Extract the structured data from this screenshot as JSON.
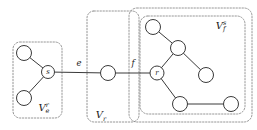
{
  "figure": {
    "type": "graph-diagram",
    "width": 257,
    "height": 130,
    "background": "#ffffff",
    "node_fill": "#ffffff",
    "node_stroke": "#3a3a3a",
    "edge_color": "#3a3a3a",
    "box_color": "#8a8a8a"
  },
  "groups": [
    {
      "id": "group-ve-r",
      "base": "V",
      "sub": "e",
      "sup": "r",
      "label_x": 44,
      "label_y": 111,
      "box": {
        "x": 13,
        "y": 42,
        "w": 49,
        "h": 76,
        "r": 7
      }
    },
    {
      "id": "group-vr",
      "base": "V",
      "sub": "r",
      "sup": "",
      "label_x": 101,
      "label_y": 118,
      "box": {
        "x": 87,
        "y": 11,
        "w": 52,
        "h": 111,
        "r": 7
      }
    },
    {
      "id": "group-vf-s-outer",
      "base": "",
      "sub": "",
      "sup": "",
      "label_x": 0,
      "label_y": 0,
      "box": {
        "x": 129,
        "y": 8,
        "w": 123,
        "h": 114,
        "r": 8
      }
    },
    {
      "id": "group-vf-s",
      "base": "V",
      "sub": "f",
      "sup": "s",
      "label_x": 221,
      "label_y": 29,
      "box": {
        "x": 140,
        "y": 16,
        "w": 105,
        "h": 98,
        "r": 8
      }
    }
  ],
  "nodes": [
    {
      "id": "n-left-top",
      "cx": 24,
      "cy": 53,
      "r": 7.5,
      "label": ""
    },
    {
      "id": "n-s",
      "cx": 48,
      "cy": 72,
      "r": 6.5,
      "label": "s"
    },
    {
      "id": "n-left-bottom",
      "cx": 24,
      "cy": 98,
      "r": 7.5,
      "label": ""
    },
    {
      "id": "n-mid",
      "cx": 108,
      "cy": 73,
      "r": 7.5,
      "label": ""
    },
    {
      "id": "n-f-top",
      "cx": 153,
      "cy": 27,
      "r": 7.5,
      "label": ""
    },
    {
      "id": "n-f-mid",
      "cx": 178,
      "cy": 48,
      "r": 7.5,
      "label": ""
    },
    {
      "id": "n-r",
      "cx": 157,
      "cy": 73,
      "r": 7.0,
      "label": "r"
    },
    {
      "id": "n-f-right",
      "cx": 206,
      "cy": 75,
      "r": 7.5,
      "label": ""
    },
    {
      "id": "n-f-botleft",
      "cx": 180,
      "cy": 104,
      "r": 7.5,
      "label": ""
    },
    {
      "id": "n-f-botright",
      "cx": 231,
      "cy": 104,
      "r": 7.5,
      "label": ""
    }
  ],
  "edges": [
    {
      "id": "e-lefttop-s",
      "x1": 24,
      "y1": 53,
      "x2": 48,
      "y2": 72,
      "label": "",
      "label_x": 0,
      "label_y": 0
    },
    {
      "id": "e-leftbot-s",
      "x1": 24,
      "y1": 98,
      "x2": 48,
      "y2": 72,
      "label": "",
      "label_x": 0,
      "label_y": 0
    },
    {
      "id": "edge-e",
      "x1": 48,
      "y1": 72,
      "x2": 108,
      "y2": 73,
      "label": "e",
      "label_x": 79,
      "label_y": 66
    },
    {
      "id": "edge-f",
      "x1": 108,
      "y1": 73,
      "x2": 157,
      "y2": 73,
      "label": "f",
      "label_x": 133,
      "label_y": 66
    },
    {
      "id": "e-ftop-fmid",
      "x1": 153,
      "y1": 27,
      "x2": 178,
      "y2": 48,
      "label": "",
      "label_x": 0,
      "label_y": 0
    },
    {
      "id": "e-fmid-r",
      "x1": 178,
      "y1": 48,
      "x2": 157,
      "y2": 73,
      "label": "",
      "label_x": 0,
      "label_y": 0
    },
    {
      "id": "e-fmid-fright",
      "x1": 178,
      "y1": 48,
      "x2": 206,
      "y2": 75,
      "label": "",
      "label_x": 0,
      "label_y": 0
    },
    {
      "id": "e-r-fbotleft",
      "x1": 157,
      "y1": 73,
      "x2": 180,
      "y2": 104,
      "label": "",
      "label_x": 0,
      "label_y": 0
    },
    {
      "id": "e-fbot-fbot",
      "x1": 180,
      "y1": 104,
      "x2": 231,
      "y2": 104,
      "label": "",
      "label_x": 0,
      "label_y": 0
    }
  ]
}
